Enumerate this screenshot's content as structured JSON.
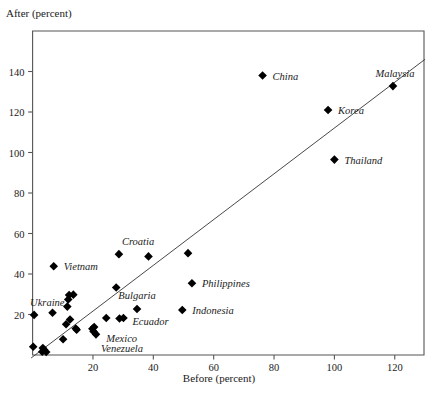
{
  "chart_data": {
    "type": "scatter",
    "title": "",
    "xlabel": "Before (percent)",
    "ylabel": "After (percent)",
    "xlim": [
      -2,
      131
    ],
    "ylim": [
      -2,
      158
    ],
    "xticks": [
      20,
      40,
      60,
      80,
      100,
      120
    ],
    "yticks": [
      20,
      40,
      60,
      80,
      100,
      120,
      140
    ],
    "grid": false,
    "legend": null,
    "marker": "filled-diamond",
    "marker_color": "#000000",
    "trendline": {
      "label": "45-degree reference line",
      "x": [
        -0.5,
        130
      ],
      "y": [
        -1.5,
        146
      ],
      "color": "#333333"
    },
    "points": [
      {
        "x": 0.5,
        "y": 19.8,
        "label": "Ukraine",
        "label_dx": -4,
        "label_dy": -13,
        "label_anchor": "start"
      },
      {
        "x": 7.0,
        "y": 43.8,
        "label": "Vietnam",
        "label_dx": 10,
        "label_dy": 0,
        "label_anchor": "start"
      },
      {
        "x": 28.6,
        "y": 49.8,
        "label": "Croatia",
        "label_dx": 3,
        "label_dy": -13,
        "label_anchor": "start"
      },
      {
        "x": 38.4,
        "y": 48.7,
        "label": null
      },
      {
        "x": 51.5,
        "y": 50.3,
        "label": null
      },
      {
        "x": 27.7,
        "y": 33.3,
        "label": null
      },
      {
        "x": 52.8,
        "y": 35.4,
        "label": "Philippines",
        "label_dx": 10,
        "label_dy": 0,
        "label_anchor": "start"
      },
      {
        "x": 49.6,
        "y": 22.2,
        "label": "Indonesia",
        "label_dx": 10,
        "label_dy": 0,
        "label_anchor": "start"
      },
      {
        "x": 34.6,
        "y": 22.7,
        "label": "Bulgaria",
        "label_dx": 0,
        "label_dy": -14,
        "label_anchor": "middle"
      },
      {
        "x": 30.1,
        "y": 18.3,
        "label": "Ecuador",
        "label_dx": 9,
        "label_dy": 3,
        "label_anchor": "start"
      },
      {
        "x": 28.8,
        "y": 18.0,
        "label": null
      },
      {
        "x": 24.4,
        "y": 18.3,
        "label": null
      },
      {
        "x": 20.4,
        "y": 13.8,
        "label": "Mexico",
        "label_dx": 12,
        "label_dy": 11,
        "label_anchor": "start"
      },
      {
        "x": 19.8,
        "y": 13.0,
        "label": null
      },
      {
        "x": 20.2,
        "y": 11.6,
        "label": null
      },
      {
        "x": 21.0,
        "y": 10.2,
        "label": "Venezuela",
        "label_dx": 5,
        "label_dy": 14,
        "label_anchor": "start"
      },
      {
        "x": 12.1,
        "y": 29.6,
        "label": null
      },
      {
        "x": 13.5,
        "y": 29.8,
        "label": null
      },
      {
        "x": 11.8,
        "y": 27.4,
        "label": null
      },
      {
        "x": 11.5,
        "y": 23.9,
        "label": null
      },
      {
        "x": 6.6,
        "y": 20.9,
        "label": null
      },
      {
        "x": 12.4,
        "y": 17.5,
        "label": null
      },
      {
        "x": 11.1,
        "y": 15.2,
        "label": null
      },
      {
        "x": 14.3,
        "y": 13.1,
        "label": null
      },
      {
        "x": 14.6,
        "y": 12.5,
        "label": null
      },
      {
        "x": 10.1,
        "y": 7.8,
        "label": null
      },
      {
        "x": 3.4,
        "y": 3.4,
        "label": null
      },
      {
        "x": 3.8,
        "y": 2.6,
        "label": null
      },
      {
        "x": 3.2,
        "y": 1.6,
        "label": null
      },
      {
        "x": 4.5,
        "y": 1.5,
        "label": null
      },
      {
        "x": 0.2,
        "y": 4.1,
        "label": null
      },
      {
        "x": 76.2,
        "y": 138.0,
        "label": "China",
        "label_dx": 10,
        "label_dy": 0,
        "label_anchor": "start"
      },
      {
        "x": 97.9,
        "y": 121.0,
        "label": "Korea",
        "label_dx": 10,
        "label_dy": 0,
        "label_anchor": "start"
      },
      {
        "x": 100.0,
        "y": 96.5,
        "label": "Thailand",
        "label_dx": 10,
        "label_dy": 0,
        "label_anchor": "start"
      },
      {
        "x": 119.4,
        "y": 132.8,
        "label": "Malaysia",
        "label_dx": 2,
        "label_dy": -13,
        "label_anchor": "middle"
      }
    ]
  }
}
